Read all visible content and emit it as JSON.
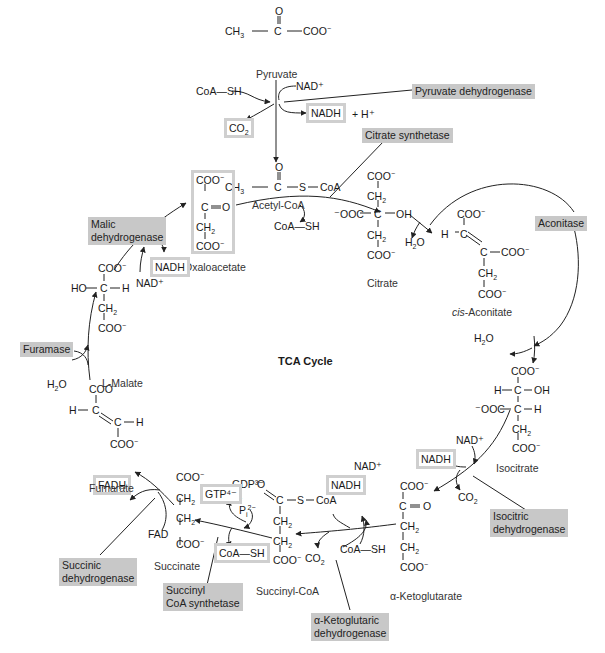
{
  "diagram": {
    "title": "TCA Cycle",
    "caption_cut_off": true
  },
  "molecules": {
    "pyruvate": {
      "name": "Pyruvate",
      "formula": [
        "O",
        "CH3—C—COO⁻"
      ]
    },
    "acetyl_coa": {
      "name": "Acetyl-CoA",
      "formula": [
        "O",
        "CH3—C—S—CoA"
      ]
    },
    "citrate": {
      "name": "Citrate",
      "rows": [
        "COO⁻",
        "CH2",
        "⁻OOC—C—OH",
        "CH2",
        "COO⁻"
      ]
    },
    "cis_aconitate": {
      "name_italic": "cis",
      "name_rest": "-Aconitate",
      "rows": [
        "COO⁻",
        "H—C",
        "C—COO⁻",
        "CH2",
        "COO⁻"
      ]
    },
    "isocitrate": {
      "name": "Isocitrate",
      "rows": [
        "COO⁻",
        "H—C—OH",
        "⁻OOC—C—H",
        "CH2",
        "COO⁻"
      ]
    },
    "alpha_ketoglutarate": {
      "name": "α-Ketoglutarate",
      "rows": [
        "COO⁻",
        "C=O",
        "CH2",
        "CH2",
        "COO⁻"
      ]
    },
    "succinyl_coa": {
      "name": "Succinyl-CoA",
      "rows": [
        "O",
        "C—S—CoA",
        "CH2",
        "CH2",
        "COO⁻"
      ]
    },
    "succinate": {
      "name": "Succinate",
      "rows": [
        "COO⁻",
        "CH2",
        "CH2",
        "COO⁻"
      ]
    },
    "fumarate": {
      "name": "Fumarate",
      "rows": [
        "COO⁻",
        "H—C",
        "C—H",
        "COO⁻"
      ]
    },
    "l_malate": {
      "name": "L-Malate",
      "rows": [
        "COO⁻",
        "HO—C—H",
        "CH2",
        "COO⁻"
      ]
    },
    "oxaloacetate": {
      "name": "Oxaloacetate",
      "rows": [
        "COO⁻",
        "C=O",
        "CH2",
        "COO⁻"
      ]
    }
  },
  "enzymes": {
    "pyruvate_dehydrogenase": "Pyruvate dehydrogenase",
    "citrate_synthetase": "Citrate synthetase",
    "aconitase": "Aconitase",
    "isocitric_dehydrogenase": [
      "Isocitric",
      "dehydrogenase"
    ],
    "alpha_ketoglutaric_dehydrogenase": [
      "α-Ketoglutaric",
      "dehydrogenase"
    ],
    "succinyl_coa_synthetase": [
      "Succinyl",
      "CoA synthetase"
    ],
    "succinic_dehydrogenase": [
      "Succinic",
      "dehydrogenase"
    ],
    "furamase": "Furamase",
    "malic_dehydrogenase": [
      "Malic",
      "dehydrogenase"
    ]
  },
  "cofactors": {
    "coa_sh": "CoA—SH",
    "nad_plus": "NAD⁺",
    "nadh": "NADH",
    "h_plus": "+ H⁺",
    "co2": "CO2",
    "h2o": "H2O",
    "gtp": "GTP⁴⁻",
    "gdp": "GDP³⁻",
    "pi": "+ Pi²⁻",
    "fad": "FAD",
    "fadh": "FADH"
  },
  "colors": {
    "enzyme_label_bg": "#c8c8c8",
    "product_box_border": "#cfcfcf",
    "line": "#222222"
  }
}
